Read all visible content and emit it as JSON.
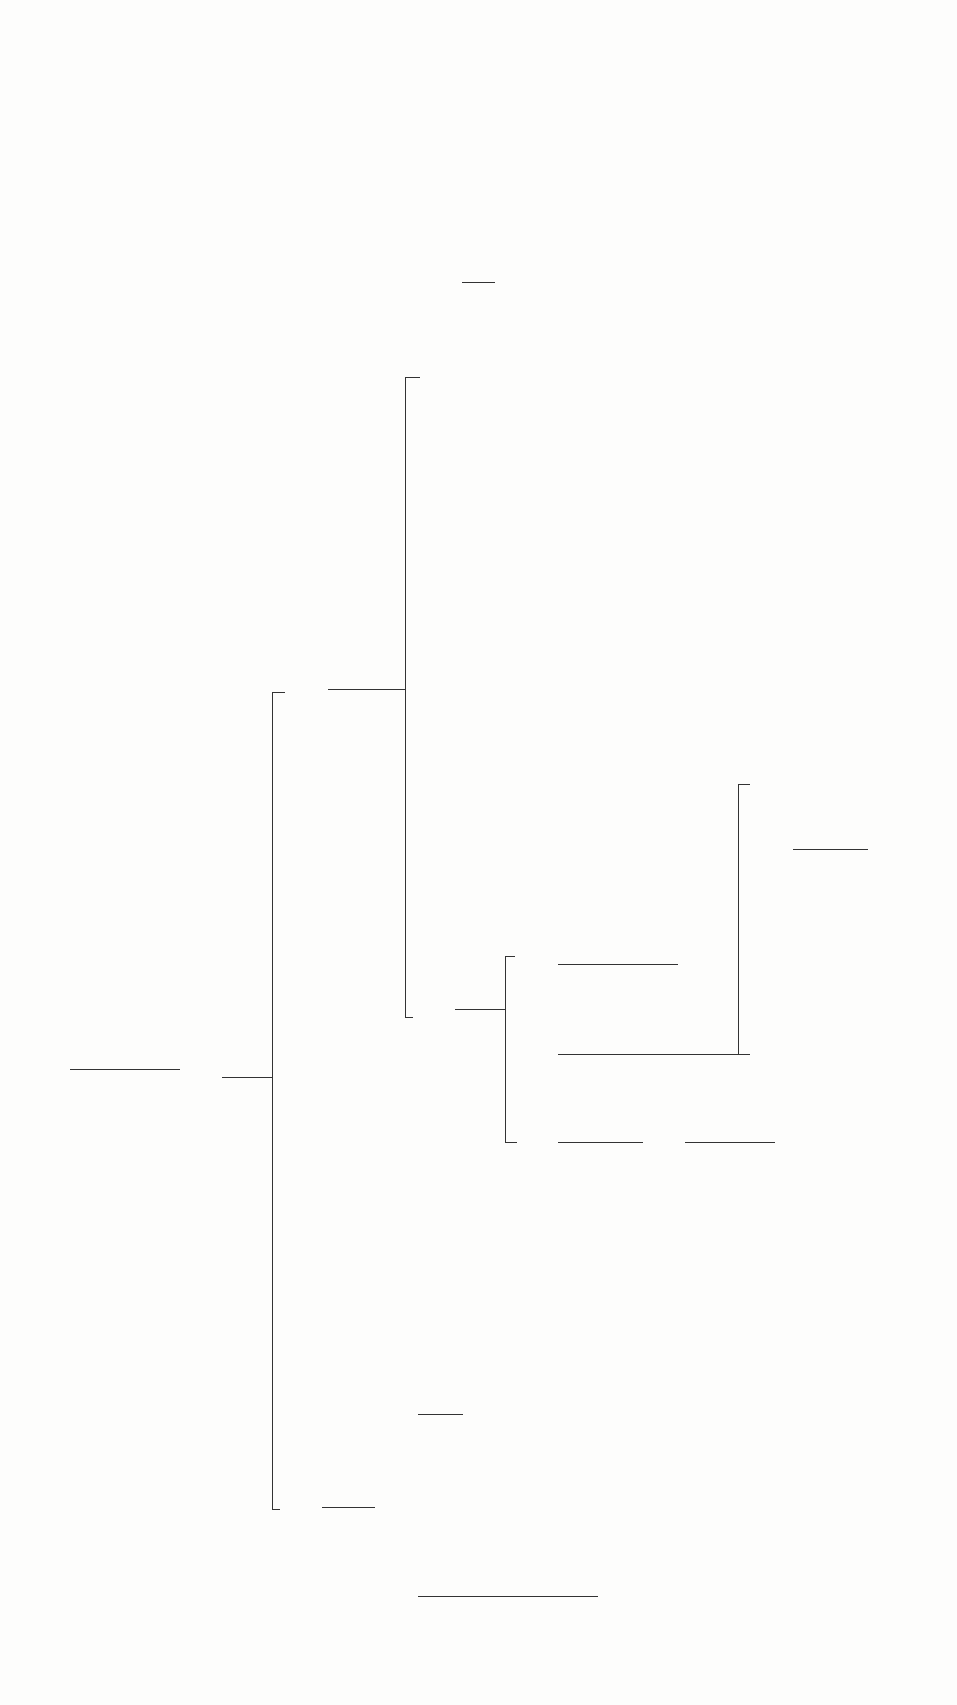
{
  "diagram": {
    "orientation": "rotated-90-ccw",
    "nodes": [
      {
        "id": "root",
        "label": "Fe²⁺, Fe³⁺, Al³⁺, Zn²⁺, Mn²⁺, Cr³⁺, Co²⁺, Ni²⁺"
      },
      {
        "id": "group_ppt",
        "label": "FeS, Al(OH)₃, ZnS, MnS, Cr(OH)₃, CoS, NiS",
        "bold": true
      },
      {
        "id": "cos_nis",
        "label": "CoS, NiS",
        "bold": true
      },
      {
        "id": "co_ni",
        "label": "Co²⁺, Ni²⁺"
      },
      {
        "id": "ni_dmg_1",
        "label": "NiC₈H₁₄N₄O₄",
        "sublabel": "rose-red",
        "bold": true
      },
      {
        "id": "co_scn",
        "label": "Co(SCN)₄²⁻",
        "sublabel": "blue"
      },
      {
        "id": "filtrate_ions",
        "label": "Fe²⁺, Al³⁺, Zn²⁺, Mn²⁺, Cr³⁺, Ni²⁺"
      },
      {
        "id": "hydroxide_ppt",
        "label": "Fe(OH)₃, MnO₂, Ni(OH)₂",
        "bold": true
      },
      {
        "id": "amphoteric",
        "label": "CrO₄²⁻, Al(OH)₄⁻, Zn(OH)₄²⁻"
      },
      {
        "id": "mno2",
        "label": "MnO₂",
        "bold": true
      },
      {
        "id": "mn2",
        "label": "Mn²⁺"
      },
      {
        "id": "mno4",
        "label": "MnO₄⁻",
        "sublabel": "purple"
      },
      {
        "id": "fe_ni",
        "label": "Fe³⁺, Ni²⁺"
      },
      {
        "id": "fescn",
        "label": "FeSCN²⁺",
        "sublabel": "red"
      },
      {
        "id": "feoh3",
        "label": "Fe(OH)₃",
        "sublabel": "brown",
        "bold": true
      },
      {
        "id": "ni_nh3",
        "label": "Ni(NH₃)₆²⁺"
      },
      {
        "id": "ni_dmg_2",
        "label": "NiC₈H₁₄N₄O₄",
        "sublabel": "rose-red",
        "bold": true
      },
      {
        "id": "aloh3",
        "label": "Al(OH)₃",
        "bold": true
      },
      {
        "id": "al_lake",
        "label": "Al(OH)₃",
        "sublabel": "lake red",
        "bold": true
      },
      {
        "id": "cro4_zn",
        "label": "CrO₄²⁻, Zn(NH₃)₄²⁺"
      },
      {
        "id": "bacro4",
        "label": "BaCrO₄",
        "bold": true
      },
      {
        "id": "cr2o7",
        "label": "Cr₂O₇²⁻"
      },
      {
        "id": "cro5",
        "label": "CrO₅",
        "sublabel": "blue"
      },
      {
        "id": "zn_nh3",
        "label": "Zn(NH₃)₄²⁺"
      },
      {
        "id": "zn_fecn",
        "label": "K₂Zn₃[Fe(CN)₆]₂",
        "sublabel": "light green",
        "bold": true
      }
    ],
    "reagents": [
      {
        "step": "(1)",
        "reagents": [
          "NH₄Cl",
          "NH₃",
          "thioacetamide"
        ]
      },
      {
        "step": "(2)",
        "reagents": [
          "HCl"
        ]
      },
      {
        "step": "(3)",
        "reagents": [
          "HCl",
          "HNO₃"
        ]
      },
      {
        "step": "(4)",
        "reagents": [
          "NH₄SCN"
        ]
      },
      {
        "step": "(5)",
        "reagents": [
          "dimethylglyoxime"
        ]
      },
      {
        "step": "(6)",
        "reagents": [
          "H₂O₂",
          "NaOH"
        ]
      },
      {
        "step": "(7)",
        "reagents": [
          "H₂SO₄"
        ]
      },
      {
        "step": "(8)",
        "reagents": [
          "H₂SO₄",
          "H₂O₂"
        ]
      },
      {
        "step": "(9)",
        "reagents": [
          "HNO₃",
          "NaBiO₃"
        ]
      },
      {
        "step": "(10)",
        "reagents": [
          "KSCN"
        ]
      },
      {
        "step": "(11)",
        "reagents": [
          "NH₃"
        ]
      },
      {
        "step": "(11)",
        "reagents": [
          "dimethylglyoxime"
        ]
      },
      {
        "step": "(12)",
        "reagents": [
          "HNO₃",
          "NH₃"
        ]
      },
      {
        "step": "(13)",
        "reagents": [
          "HNO₃",
          "aluminon",
          "NH₃"
        ]
      },
      {
        "step": "(14)",
        "reagents": [
          "BaCl₂"
        ]
      },
      {
        "step": "(15)",
        "reagents": [
          "HNO₃"
        ]
      },
      {
        "step": "(15)",
        "reagents": [
          "H₂O₂"
        ]
      },
      {
        "step": "(16)",
        "reagents": [
          "K₄Fe(CN)₆"
        ]
      }
    ]
  }
}
